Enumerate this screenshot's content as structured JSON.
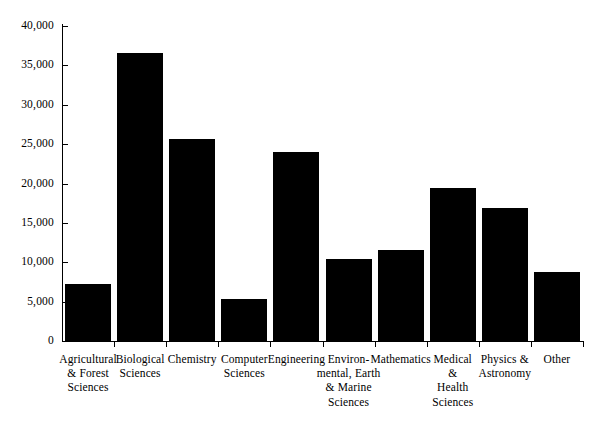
{
  "chart_data": {
    "type": "bar",
    "title": "",
    "subtitle": "",
    "xlabel": "",
    "ylabel": "",
    "ylim": [
      0,
      40000
    ],
    "ytick_values": [
      0,
      5000,
      10000,
      15000,
      20000,
      25000,
      30000,
      35000,
      40000
    ],
    "ytick_labels": [
      "0",
      "5,000",
      "10,000",
      "15,000",
      "20,000",
      "25,000",
      "30,000",
      "35,000",
      "40,000"
    ],
    "grid": false,
    "legend": false,
    "legend_position": "none",
    "bar_color": "#000000",
    "background_color": "#FFFFFF",
    "axis_color": "#000000",
    "categories": [
      "Agricultural\n& Forest\nSciences",
      "Biological\nSciences",
      "Chemistry",
      "Computer\nSciences",
      "Engineering",
      "Environ-\nmental, Earth\n& Marine\nSciences",
      "Mathematics",
      "Medical\n&\nHealth\nSciences",
      "Physics &\nAstronomy",
      "Other"
    ],
    "values": [
      7250,
      36550,
      25650,
      5350,
      24000,
      10400,
      11550,
      19450,
      16900,
      8750
    ]
  },
  "axis": {
    "y_axis_name": "y-axis",
    "x_axis_name": "x-axis"
  }
}
